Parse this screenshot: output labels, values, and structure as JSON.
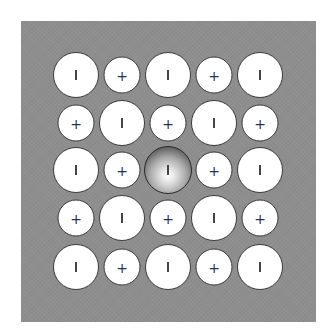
{
  "diagram": {
    "background_color": "#8e8e8e",
    "grid": {
      "rows": 5,
      "cols": 5,
      "row_centers_y": [
        75,
        123,
        170,
        218,
        267
      ],
      "col_centers_x": [
        76,
        122,
        168,
        214,
        260
      ]
    },
    "ions": [
      {
        "row": 0,
        "col": 0,
        "type": "anion",
        "symbol": "−"
      },
      {
        "row": 0,
        "col": 1,
        "type": "cation",
        "symbol": "+"
      },
      {
        "row": 0,
        "col": 2,
        "type": "anion",
        "symbol": "−"
      },
      {
        "row": 0,
        "col": 3,
        "type": "cation",
        "symbol": "+"
      },
      {
        "row": 0,
        "col": 4,
        "type": "anion",
        "symbol": "−"
      },
      {
        "row": 1,
        "col": 0,
        "type": "cation",
        "symbol": "+"
      },
      {
        "row": 1,
        "col": 1,
        "type": "anion",
        "symbol": "−"
      },
      {
        "row": 1,
        "col": 2,
        "type": "cation",
        "symbol": "+"
      },
      {
        "row": 1,
        "col": 3,
        "type": "anion",
        "symbol": "−"
      },
      {
        "row": 1,
        "col": 4,
        "type": "cation",
        "symbol": "+"
      },
      {
        "row": 2,
        "col": 0,
        "type": "anion",
        "symbol": "−"
      },
      {
        "row": 2,
        "col": 1,
        "type": "cation",
        "symbol": "+"
      },
      {
        "row": 2,
        "col": 2,
        "type": "anion",
        "symbol": "−",
        "highlighted": true
      },
      {
        "row": 2,
        "col": 3,
        "type": "cation",
        "symbol": "+"
      },
      {
        "row": 2,
        "col": 4,
        "type": "anion",
        "symbol": "−"
      },
      {
        "row": 3,
        "col": 0,
        "type": "cation",
        "symbol": "+"
      },
      {
        "row": 3,
        "col": 1,
        "type": "anion",
        "symbol": "−"
      },
      {
        "row": 3,
        "col": 2,
        "type": "cation",
        "symbol": "+"
      },
      {
        "row": 3,
        "col": 3,
        "type": "anion",
        "symbol": "−"
      },
      {
        "row": 3,
        "col": 4,
        "type": "cation",
        "symbol": "+"
      },
      {
        "row": 4,
        "col": 0,
        "type": "anion",
        "symbol": "−"
      },
      {
        "row": 4,
        "col": 1,
        "type": "cation",
        "symbol": "+"
      },
      {
        "row": 4,
        "col": 2,
        "type": "anion",
        "symbol": "−"
      },
      {
        "row": 4,
        "col": 3,
        "type": "cation",
        "symbol": "+"
      },
      {
        "row": 4,
        "col": 4,
        "type": "anion",
        "symbol": "−"
      }
    ]
  }
}
